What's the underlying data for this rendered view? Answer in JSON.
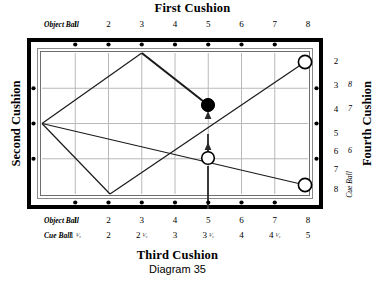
{
  "titles": {
    "first_cushion": "First Cushion",
    "second_cushion": "Second Cushion",
    "third_cushion": "Third Cushion",
    "fourth_cushion": "Fourth Cushion",
    "diagram": "Diagram 35"
  },
  "labels": {
    "object_ball": "Object Ball",
    "cue_ball": "Cue Ball",
    "cue_ball_vertical": "Cue Ball"
  },
  "top_scale": {
    "label": "Object Ball",
    "values": [
      "1",
      "2",
      "3",
      "4",
      "5",
      "6",
      "7",
      "8"
    ]
  },
  "bottom_scale_object": {
    "label": "Object Ball",
    "values": [
      "1",
      "2",
      "3",
      "4",
      "5",
      "6",
      "7",
      "8"
    ]
  },
  "bottom_scale_cue": {
    "label": "Cue Ball",
    "values": [
      "1 1/2",
      "2",
      "2 1/2",
      "3",
      "3 1/2",
      "4",
      "4 1/2",
      "5"
    ],
    "whole": [
      "1",
      "2",
      "2",
      "3",
      "3",
      "4",
      "4",
      "5"
    ],
    "fraction": [
      "1/2",
      "",
      "1/2",
      "",
      "1/2",
      "",
      "1/2",
      ""
    ]
  },
  "right_scale_outer": {
    "values": [
      "2",
      "3",
      "4",
      "5",
      "6",
      "7",
      "8"
    ]
  },
  "right_scale_inner": {
    "label": "Cue Ball",
    "values": [
      "8",
      "7",
      "6"
    ]
  },
  "balls": [
    {
      "name": "object-ball",
      "type": "black",
      "x": 208,
      "y": 105
    },
    {
      "name": "cue-ball",
      "type": "white",
      "x": 208,
      "y": 158
    },
    {
      "name": "target-ball-top",
      "type": "white",
      "x": 305,
      "y": 62
    },
    {
      "name": "target-ball-bottom",
      "type": "white",
      "x": 305,
      "y": 185
    }
  ],
  "colors": {
    "rail": "#000000",
    "cloth": "#ffffff",
    "grid": "#b8b8b8",
    "path": "#1a1a1a",
    "ball_black": "#000000",
    "ball_white": "#ffffff"
  },
  "paths": {
    "shot_path_description": "object ball to first cushion, second cushion, third cushion, fourth cushion",
    "aim_line_description": "cue ball straight up to object ball"
  }
}
